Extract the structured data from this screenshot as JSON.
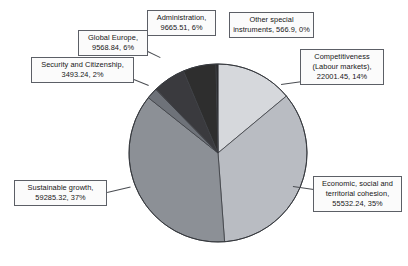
{
  "chart_data": {
    "type": "pie",
    "title": "",
    "subtitle": "",
    "xlabel": "",
    "ylabel": "",
    "legend_position": "callout-labels",
    "grid": false,
    "value_unit": "EUR million",
    "label_format": "{name}, {value}, {percent}",
    "total_percent": "100%",
    "start_angle_deg": 0,
    "direction": "clockwise",
    "categories": [
      "Competitiveness (Labour markets)",
      "Economic, social and territorial cohesion",
      "Sustainable growth",
      "Security and Citizenship",
      "Global Europe",
      "Administration",
      "Other special instruments"
    ],
    "values": [
      22001.45,
      55532.24,
      59285.32,
      3493.24,
      9568.84,
      9665.51,
      566.9
    ],
    "percents": [
      "14%",
      "35%",
      "37%",
      "2%",
      "6%",
      "6%",
      "0%"
    ],
    "colors": [
      "#d6d8dc",
      "#b9bcc2",
      "#8c9096",
      "#6e7279",
      "#3a3a3e",
      "#2e2e2e",
      "#1f1f21"
    ],
    "slices": [
      {
        "id": "competitiveness",
        "name": "Competitiveness (Labour markets)",
        "value": 22001.45,
        "percent": "14%",
        "percent_num": 14,
        "color": "#d6d8dc",
        "label_lines": [
          "Competitiveness",
          "(Labour markets),",
          "22001.45, 14%"
        ]
      },
      {
        "id": "economic",
        "name": "Economic, social and territorial cohesion",
        "value": 55532.24,
        "percent": "35%",
        "percent_num": 35,
        "color": "#b9bcc2",
        "label_lines": [
          "Economic, social and",
          "territorial cohesion,",
          "55532.24, 35%"
        ]
      },
      {
        "id": "sustainable",
        "name": "Sustainable growth",
        "value": 59285.32,
        "percent": "37%",
        "percent_num": 37,
        "color": "#8c9096",
        "label_lines": [
          "Sustainable growth,",
          "59285.32, 37%"
        ]
      },
      {
        "id": "security",
        "name": "Security and Citizenship",
        "value": 3493.24,
        "percent": "2%",
        "percent_num": 2,
        "color": "#6e7279",
        "label_lines": [
          "Security and Citizenship,",
          "3493.24, 2%"
        ]
      },
      {
        "id": "global-europe",
        "name": "Global Europe",
        "value": 9568.84,
        "percent": "6%",
        "percent_num": 6,
        "color": "#3a3a3e",
        "label_lines": [
          "Global Europe,",
          "9568.84, 6%"
        ]
      },
      {
        "id": "administration",
        "name": "Administration",
        "value": 9665.51,
        "percent": "6%",
        "percent_num": 6,
        "color": "#2e2e2e",
        "label_lines": [
          "Administration,",
          "9665.51, 6%"
        ]
      },
      {
        "id": "other-special",
        "name": "Other special instruments",
        "value": 566.9,
        "percent": "0%",
        "percent_num": 0.36,
        "color": "#1f1f21",
        "label_lines": [
          "Other special",
          "instruments, 566.9, 0%"
        ]
      }
    ]
  },
  "callouts": {
    "administration": {
      "l1": "Administration,",
      "l2": "9665.51, 6%"
    },
    "other_special": {
      "l1": "Other special",
      "l2": "instruments, 566.9, 0%"
    },
    "competitiveness": {
      "l1": "Competitiveness",
      "l2": "(Labour markets),",
      "l3": "22001.45, 14%"
    },
    "economic": {
      "l1": "Economic, social and",
      "l2": "territorial cohesion,",
      "l3": "55532.24, 35%"
    },
    "sustainable": {
      "l1": "Sustainable growth,",
      "l2": "59285.32, 37%"
    },
    "security": {
      "l1": "Security and Citizenship,",
      "l2": "3493.24, 2%"
    },
    "global_europe": {
      "l1": "Global Europe,",
      "l2": "9568.84, 6%"
    }
  }
}
